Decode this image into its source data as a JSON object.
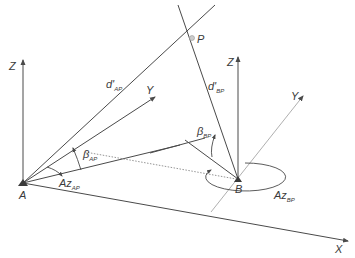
{
  "diagram": {
    "type": "3D surveying geometry (azimuth/elevation intersection)",
    "points": {
      "A": "A",
      "B": "B",
      "P": "P"
    },
    "axes": {
      "A_z": "Z",
      "A_y": "Y",
      "B_z": "Z",
      "B_y": "Y",
      "x": "X"
    },
    "labels": {
      "d_ap_main": "d'",
      "d_ap_sub": "AP",
      "d_bp_main": "d'",
      "d_bp_sub": "BP",
      "beta_ap_main": "β",
      "beta_ap_sub": "AP",
      "beta_bp_main": "β",
      "beta_bp_sub": "BP",
      "az_ap_main": "Az",
      "az_ap_sub": "AP",
      "az_bp_main": "Az",
      "az_bp_sub": "BP"
    },
    "colors": {
      "line": "#4a4a4a",
      "light_line": "#9a9a9a",
      "text": "#3a3a3a"
    }
  }
}
